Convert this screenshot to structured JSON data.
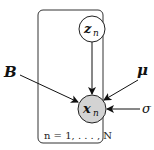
{
  "diagram": {
    "type": "graphical-model-plate-notation",
    "colors": {
      "observed_fill": "#d3d3d3",
      "latent_fill": "#ffffff",
      "stroke": "#222222"
    },
    "nodes": {
      "z": {
        "label": "z",
        "subscript": "n",
        "observed": false
      },
      "x": {
        "label": "x",
        "subscript": "n",
        "observed": true
      }
    },
    "parameters": {
      "B": {
        "label": "B"
      },
      "mu": {
        "label": "μ"
      },
      "sigma": {
        "label": "σ"
      }
    },
    "plate": {
      "label": "n = 1, . . . , N"
    },
    "edges": [
      {
        "from": "z",
        "to": "x"
      },
      {
        "from": "B",
        "to": "x"
      },
      {
        "from": "mu",
        "to": "x"
      },
      {
        "from": "sigma",
        "to": "x"
      }
    ]
  }
}
